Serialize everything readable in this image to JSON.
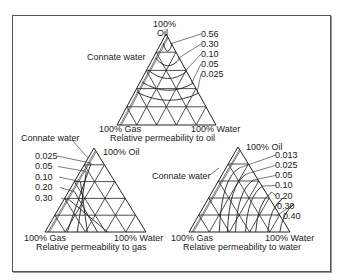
{
  "figure": {
    "diagrams": [
      {
        "id": "oil",
        "caption": "Relative permeability to oil",
        "apex_label_line1": "100%",
        "apex_label_line2": "Oil",
        "left_label": "100% Gas",
        "right_label": "100% Water",
        "connate_label": "Connate water",
        "isoperm_values": [
          "0.56",
          "0.30",
          "0.10",
          "0.05",
          "0.025"
        ]
      },
      {
        "id": "gas",
        "caption": "Relative permeability to gas",
        "apex_label": "100% Oil",
        "left_label": "100% Gas",
        "right_label": "100% Water",
        "connate_label": "Connate water",
        "isoperm_values": [
          "0.025",
          "0.05",
          "0.10",
          "0.20",
          "0.30"
        ]
      },
      {
        "id": "water",
        "caption": "Relative permeability to water",
        "apex_label": "100% Oil",
        "left_label": "100% Gas",
        "right_label": "100% Water",
        "connate_label": "Connate water",
        "isoperm_values": [
          "0.013",
          "0.025",
          "0.05",
          "0.10",
          "0.20",
          "0.30",
          "0.40"
        ]
      }
    ],
    "colors": {
      "line": "#222222",
      "frame": "#555555",
      "background": "#ffffff"
    }
  }
}
